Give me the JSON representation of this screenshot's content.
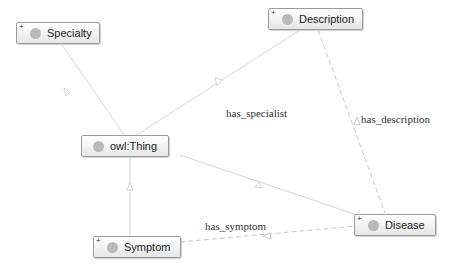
{
  "nodes": {
    "specialty": {
      "label": "Specialty",
      "expandable": true
    },
    "description": {
      "label": "Description",
      "expandable": true
    },
    "thing": {
      "label": "owl:Thing",
      "expandable": false
    },
    "symptom": {
      "label": "Symptom",
      "expandable": true
    },
    "disease": {
      "label": "Disease",
      "expandable": true
    }
  },
  "expand_glyph": "+",
  "edge_labels": {
    "has_specialist": "has_specialist",
    "has_description": "has_description",
    "has_symptom": "has_symptom"
  },
  "colors": {
    "edge": "#cfcfcf",
    "node_border": "#9a9a9a",
    "dot": "#b9b9b9"
  }
}
